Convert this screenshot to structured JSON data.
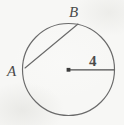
{
  "figure": {
    "kind": "circle-geometry-diagram",
    "canvas": {
      "width": 124,
      "height": 125
    },
    "background_color": "#f7f7f5",
    "stroke_color": "#6a6a6a",
    "label_color": "#4a4a4a",
    "circle": {
      "center_x": 68.5,
      "center_y": 69.5,
      "radius": 46
    },
    "points": [
      {
        "id": "A",
        "label": "A",
        "x": 25.0,
        "y": 68.0,
        "on_circle": true
      },
      {
        "id": "B",
        "label": "B",
        "x": 78.0,
        "y": 24.0,
        "on_circle": true
      },
      {
        "id": "O",
        "label": "",
        "x": 68.5,
        "y": 69.5,
        "on_circle": false,
        "is_center": true
      },
      {
        "id": "R",
        "label": "",
        "x": 114.5,
        "y": 69.5,
        "on_circle": true
      }
    ],
    "segments": [
      {
        "id": "chord-AB",
        "from": "A",
        "to": "B",
        "label": ""
      },
      {
        "id": "radius-OR",
        "from": "O",
        "to": "R",
        "label": "4"
      }
    ],
    "labels": {
      "point_a": "A",
      "point_b": "B",
      "radius_measure": "4"
    }
  }
}
